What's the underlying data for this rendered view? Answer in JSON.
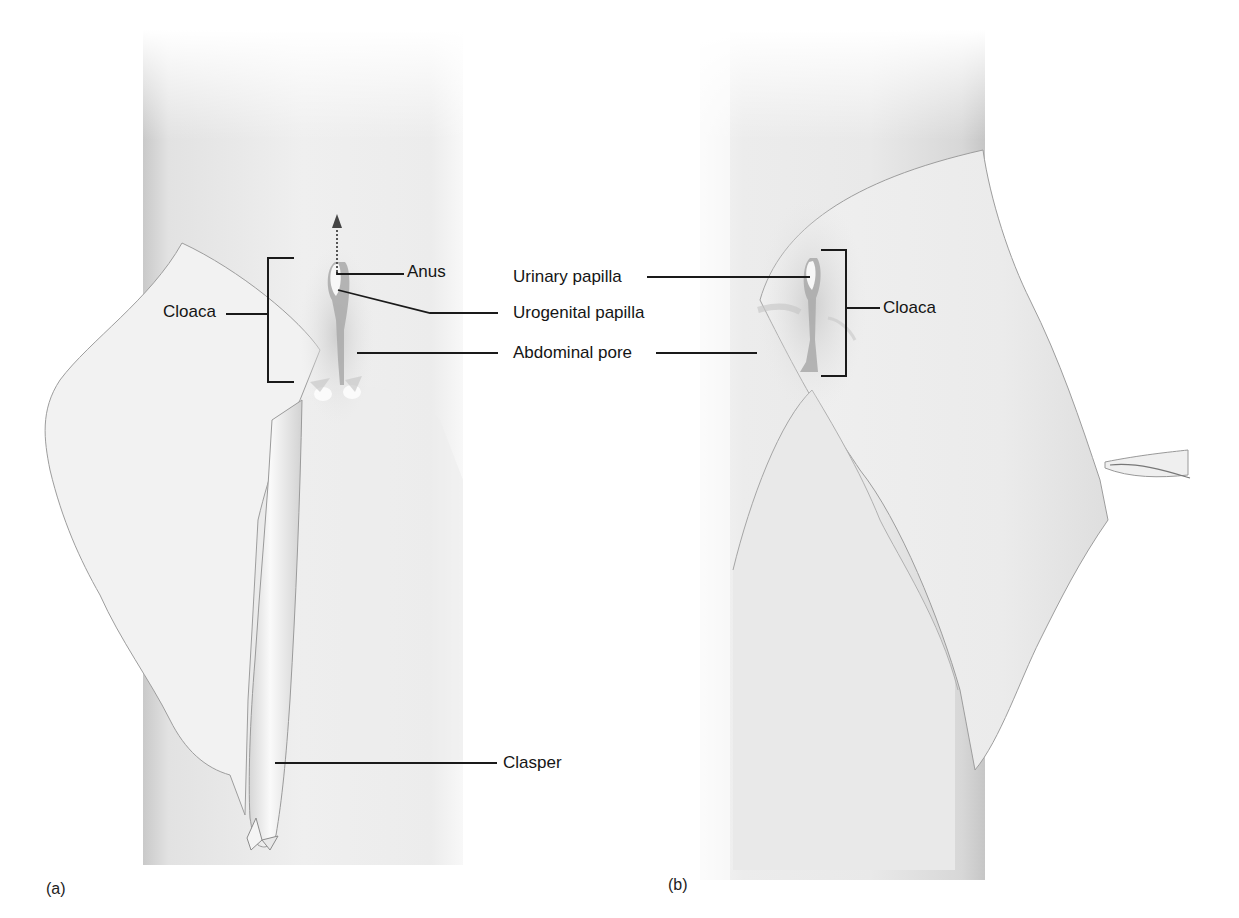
{
  "figure": {
    "panels": [
      {
        "id": "a",
        "letter": "(a)",
        "labels": {
          "cloaca": "Cloaca",
          "anus": "Anus",
          "urogenital_papilla": "Urogenital papilla",
          "abdominal_pore": "Abdominal pore",
          "clasper": "Clasper"
        }
      },
      {
        "id": "b",
        "letter": "(b)",
        "labels": {
          "urinary_papilla": "Urinary papilla",
          "cloaca": "Cloaca"
        }
      }
    ],
    "colors": {
      "background": "#ffffff",
      "body_shade": "#e4e4e4",
      "fin_fill": "#f1f1f1",
      "outline": "#9a9a9a",
      "leader_line": "#1a1a1a",
      "papilla": "#a8a8a8"
    }
  }
}
